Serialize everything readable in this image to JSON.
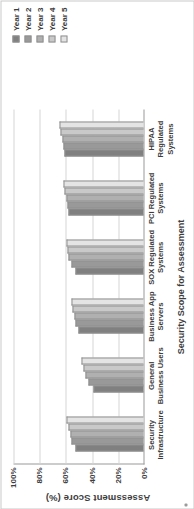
{
  "chart_data": {
    "type": "bar",
    "title": "",
    "xlabel": "Security Scope for Assessment",
    "ylabel": "Assessment Score (%)",
    "categories": [
      "Security Infrastructure",
      "General Business Users",
      "Business App Servers",
      "SOX Regulated Systems",
      "PCI Regulated Systems",
      "HIPAA Regulated Systems"
    ],
    "series": [
      {
        "name": "Year 1",
        "color": "#808080",
        "values": [
          52,
          38,
          50,
          52,
          57,
          60
        ]
      },
      {
        "name": "Year 2",
        "color": "#999999",
        "values": [
          55,
          42,
          52,
          55,
          58,
          61
        ]
      },
      {
        "name": "Year 3",
        "color": "#b0b0b0",
        "values": [
          56,
          44,
          53,
          57,
          59,
          62
        ]
      },
      {
        "name": "Year 4",
        "color": "#c9c9c9",
        "values": [
          57,
          46,
          54,
          58,
          60,
          63
        ]
      },
      {
        "name": "Year 5",
        "color": "#e4e4e4",
        "values": [
          59,
          47,
          55,
          59,
          61,
          64
        ]
      }
    ],
    "ylim": [
      0,
      100
    ],
    "yticks": [
      "0%",
      "20%",
      "40%",
      "60%",
      "80%",
      "100%"
    ],
    "ytick_values": [
      0,
      20,
      40,
      60,
      80,
      100
    ],
    "grid": true,
    "legend_position": "right"
  }
}
